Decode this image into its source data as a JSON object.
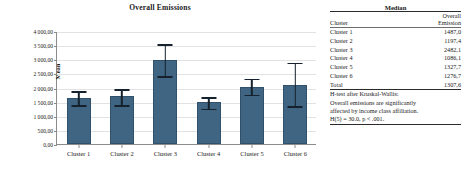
{
  "chart_data": {
    "type": "bar",
    "title": "Overall Emissions",
    "xlabel": "",
    "ylabel": "Mean",
    "categories": [
      "Cluster 1",
      "Cluster 2",
      "Cluster 3",
      "Cluster 4",
      "Cluster 5",
      "Cluster 6"
    ],
    "values": [
      1620,
      1690,
      2985,
      1480,
      2020,
      2105
    ],
    "error_low": [
      1360,
      1360,
      2380,
      1230,
      1720,
      1325
    ],
    "error_high": [
      1900,
      1965,
      3570,
      1690,
      2350,
      2910
    ],
    "ylim": [
      0,
      4000
    ],
    "ytick_values": [
      0,
      500,
      1000,
      1500,
      2000,
      2500,
      3000,
      3500,
      4000
    ],
    "ytick_labels": [
      "0,00",
      "500,00",
      "1 000,00",
      "1 500,00",
      "2 000,00",
      "2 500,00",
      "3 000,00",
      "3 500,00",
      "4 000,00"
    ],
    "grid": true,
    "legend": "none",
    "bar_color": "#3f6582",
    "error_color": "#15212c"
  },
  "table": {
    "caption": "Median",
    "headers": {
      "col1": "Cluster",
      "col2_line1": "Overall",
      "col2_line2": "Emission"
    },
    "rows": [
      {
        "cluster": "Cluster 1",
        "value": "1487,0"
      },
      {
        "cluster": "Cluster 2",
        "value": "1197,4"
      },
      {
        "cluster": "Cluster 3",
        "value": "2482,1"
      },
      {
        "cluster": "Cluster 4",
        "value": "1086,1"
      },
      {
        "cluster": "Cluster 5",
        "value": "1327,7"
      },
      {
        "cluster": "Cluster 6",
        "value": "1276,7"
      },
      {
        "cluster": "Total",
        "value": "1307,6"
      }
    ],
    "note": [
      "H-test after Kruskal-Wallis:",
      "Overall emissions are significantly",
      "affected by income class affiliation.",
      "H(5) = 30.0, p < .001."
    ]
  }
}
